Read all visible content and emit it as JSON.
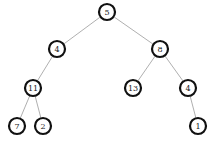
{
  "diagram": {
    "type": "binary-tree",
    "nodes": [
      {
        "id": "n5",
        "label": "5",
        "x": 107,
        "y": 12
      },
      {
        "id": "n4a",
        "label": "4",
        "x": 57,
        "y": 49
      },
      {
        "id": "n8",
        "label": "8",
        "x": 160,
        "y": 49
      },
      {
        "id": "n11",
        "label": "11",
        "x": 33,
        "y": 88
      },
      {
        "id": "n13",
        "label": "13",
        "x": 133,
        "y": 88
      },
      {
        "id": "n4b",
        "label": "4",
        "x": 188,
        "y": 88
      },
      {
        "id": "n7",
        "label": "7",
        "x": 17,
        "y": 126
      },
      {
        "id": "n2",
        "label": "2",
        "x": 43,
        "y": 126
      },
      {
        "id": "n1",
        "label": "1",
        "x": 198,
        "y": 126
      }
    ],
    "edges": [
      [
        "n5",
        "n4a"
      ],
      [
        "n5",
        "n8"
      ],
      [
        "n4a",
        "n11"
      ],
      [
        "n8",
        "n13"
      ],
      [
        "n8",
        "n4b"
      ],
      [
        "n11",
        "n7"
      ],
      [
        "n11",
        "n2"
      ],
      [
        "n4b",
        "n1"
      ]
    ],
    "node_radius": 8
  }
}
